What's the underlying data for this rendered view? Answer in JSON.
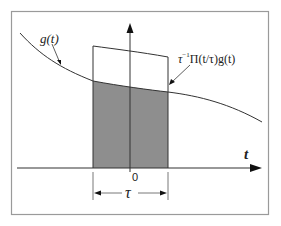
{
  "diagram": {
    "title": "",
    "labels": {
      "g_curve": "g(t)",
      "product": "τ⁻¹Π(t/τ)g(t)",
      "product_prefix": "τ",
      "product_exp": "−1",
      "product_body": "Π(t/τ)g(t)",
      "t_axis": "t",
      "origin": "0",
      "width": "τ"
    },
    "colors": {
      "frame": "#9a9a9a",
      "line": "#333333",
      "shade": "#8e8e8e",
      "background": "#ffffff"
    },
    "elements": [
      "frame",
      "time-axis",
      "vertical-axis",
      "g-curve",
      "rect-pulse-scaled",
      "shaded-product-area",
      "tau-dimension-marker"
    ]
  }
}
